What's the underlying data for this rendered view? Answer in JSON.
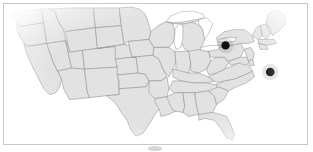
{
  "figure": {
    "name": "us-map-with-two-location-markers",
    "width": 313,
    "height": 152,
    "background_color": "#ffffff",
    "frame": {
      "border_color": "#c9c9c9",
      "border_width_px": 1,
      "left": 3,
      "top": 3,
      "width": 305,
      "height": 142
    }
  },
  "map": {
    "region": "Contiguous United States",
    "projection_style": "state-outline-choropleth",
    "land_fill_color": "#e2e2e2",
    "state_border_color": "#8e8e8e",
    "water_fill_color": "#ffffff",
    "edge_fade": "radial white vignette",
    "state_border_width_px": 0.55
  },
  "markers": [
    {
      "id": "marker-1",
      "label": "",
      "approx_location": "Indiana / western Ohio",
      "x": 226,
      "y": 45,
      "radius_px": 4.2,
      "color": "#111111"
    },
    {
      "id": "marker-2",
      "label": "",
      "approx_location": "coastal North Carolina",
      "x": 271,
      "y": 72,
      "radius_px": 4.4,
      "color": "#111111"
    }
  ],
  "artifact": {
    "name": "bottom-smudge",
    "visible": true,
    "x": 148,
    "y": 146
  },
  "chart_data": {
    "type": "map",
    "title": "",
    "subtitle": "",
    "xlabel": "",
    "ylabel": "",
    "legend": [],
    "annotations": [],
    "series": [
      {
        "name": "locations",
        "marker_style": "filled-circle",
        "marker_color": "#111111",
        "points": [
          {
            "label": "",
            "region": "Indiana / western Ohio",
            "px_x": 226,
            "px_y": 45
          },
          {
            "label": "",
            "region": "coastal North Carolina",
            "px_x": 271,
            "px_y": 72
          }
        ]
      }
    ],
    "basemap": {
      "name": "Contiguous United States state boundaries",
      "land_fill": "#e2e2e2",
      "border_color": "#8e8e8e"
    }
  }
}
